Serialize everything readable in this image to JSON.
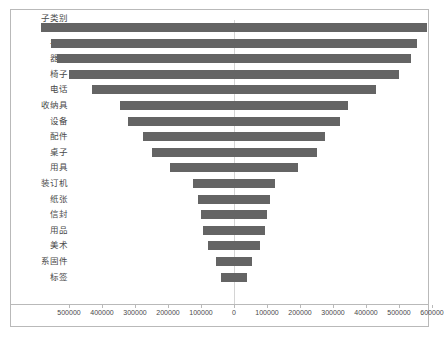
{
  "chart_data": {
    "type": "bar",
    "subtype": "diverging-mirrored-horizontal-bar",
    "title": "",
    "xlabel": "",
    "ylabel": "子类别",
    "axis_header": "子类别",
    "grid": false,
    "legend": "none",
    "orientation": "horizontal",
    "xlim": [
      -550000,
      650000
    ],
    "zero_at": 0,
    "xticks": [
      -500000,
      -400000,
      -300000,
      -200000,
      -100000,
      0,
      100000,
      200000,
      300000,
      400000,
      500000,
      600000
    ],
    "xtick_labels": [
      "500000",
      "400000",
      "300000",
      "200000",
      "100000",
      "0",
      "100000",
      "200000",
      "300000",
      "400000",
      "500000",
      "600000"
    ],
    "categories": [
      "复印机",
      "书架",
      "器具",
      "椅子",
      "电话",
      "收纳具",
      "设备",
      "配件",
      "桌子",
      "用具",
      "装订机",
      "纸张",
      "信封",
      "用品",
      "美术",
      "系固件",
      "标签"
    ],
    "values": [
      585000,
      555000,
      535000,
      500000,
      430000,
      345000,
      320000,
      275000,
      250000,
      195000,
      125000,
      110000,
      100000,
      95000,
      80000,
      55000,
      40000
    ],
    "series": [
      {
        "name": "销售额",
        "values": [
          585000,
          555000,
          535000,
          500000,
          430000,
          345000,
          320000,
          275000,
          250000,
          195000,
          125000,
          110000,
          100000,
          95000,
          80000,
          55000,
          40000
        ]
      }
    ],
    "bar_color": "#646464",
    "frame_color": "#b9b9b9",
    "text_color": "#4a4a4a",
    "zero_line_color": "#d4d4d4"
  }
}
